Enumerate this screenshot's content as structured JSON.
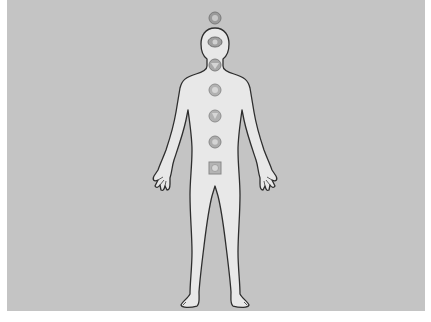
{
  "image": {
    "subject": "Human body outline with seven chakra symbols",
    "background_color": "#c4c4c4",
    "border_color": "#ffffff",
    "body_fill": "#e6e6e6",
    "outline_color": "#333333",
    "chakra_color": "#8a8a8a"
  },
  "chakras": [
    {
      "name": "crown",
      "x": 215,
      "y": 18,
      "r": 6
    },
    {
      "name": "third-eye",
      "x": 215,
      "y": 42,
      "r": 6
    },
    {
      "name": "throat",
      "x": 215,
      "y": 65,
      "r": 6
    },
    {
      "name": "heart",
      "x": 215,
      "y": 90,
      "r": 6
    },
    {
      "name": "solar-plexus",
      "x": 215,
      "y": 116,
      "r": 6
    },
    {
      "name": "sacral",
      "x": 215,
      "y": 142,
      "r": 6
    },
    {
      "name": "root",
      "x": 215,
      "y": 168,
      "r": 6
    }
  ]
}
